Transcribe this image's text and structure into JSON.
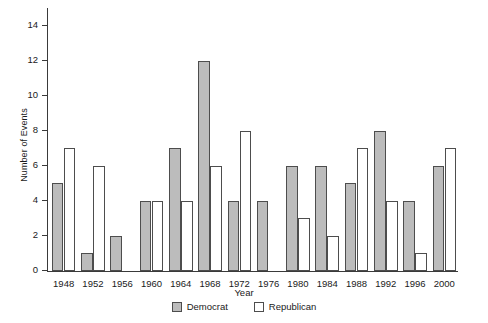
{
  "chart_data": {
    "type": "bar",
    "title": "",
    "xlabel": "Year",
    "ylabel": "Number of Events",
    "categories": [
      "1948",
      "1952",
      "1956",
      "1960",
      "1964",
      "1968",
      "1972",
      "1976",
      "1980",
      "1984",
      "1988",
      "1992",
      "1996",
      "2000"
    ],
    "series": [
      {
        "name": "Democrat",
        "color": "#bcbcbc",
        "values": [
          5,
          1,
          2,
          4,
          7,
          12,
          4,
          4,
          6,
          6,
          5,
          8,
          4,
          6
        ]
      },
      {
        "name": "Republican",
        "color": "#ffffff",
        "values": [
          7,
          6,
          0,
          4,
          4,
          6,
          8,
          0,
          3,
          2,
          7,
          4,
          1,
          7
        ]
      }
    ],
    "ylim": [
      0,
      15
    ],
    "yticks": [
      0,
      2,
      4,
      6,
      8,
      10,
      12,
      14
    ],
    "ytick_labels": [
      "0",
      "2",
      "4",
      "6",
      "8",
      "10",
      "12",
      "14"
    ],
    "grid": false,
    "legend_position": "bottom-center"
  }
}
